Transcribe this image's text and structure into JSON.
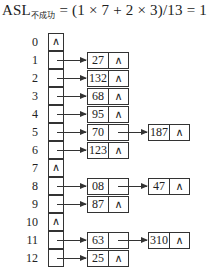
{
  "formula": {
    "lhs": "ASL",
    "subscript": "不成功",
    "rhs": "= (1 × 7 + 2 × 3)/13 = 1"
  },
  "hash_table": {
    "slots": [
      {
        "index": "0",
        "chain": []
      },
      {
        "index": "1",
        "chain": [
          "27"
        ]
      },
      {
        "index": "2",
        "chain": [
          "132"
        ]
      },
      {
        "index": "3",
        "chain": [
          "68"
        ]
      },
      {
        "index": "4",
        "chain": [
          "95"
        ]
      },
      {
        "index": "5",
        "chain": [
          "70",
          "187"
        ]
      },
      {
        "index": "6",
        "chain": [
          "123"
        ]
      },
      {
        "index": "7",
        "chain": []
      },
      {
        "index": "8",
        "chain": [
          "08",
          "47"
        ]
      },
      {
        "index": "9",
        "chain": [
          "87"
        ]
      },
      {
        "index": "10",
        "chain": []
      },
      {
        "index": "11",
        "chain": [
          "63",
          "310"
        ]
      },
      {
        "index": "12",
        "chain": [
          "25"
        ]
      }
    ],
    "null_symbol": "∧"
  }
}
